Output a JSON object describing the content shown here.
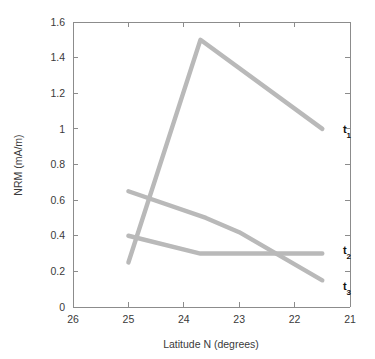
{
  "chart_data": {
    "type": "line",
    "title": "",
    "xlabel": "Latitude N (degrees)",
    "ylabel": "NRM (mA/m)",
    "xlim": [
      26,
      21
    ],
    "ylim": [
      0,
      1.6
    ],
    "x_reversed": true,
    "grid": false,
    "legend_position": "inline-right-end-labels",
    "xticks": [
      26,
      25,
      24,
      23,
      22,
      21
    ],
    "xtick_labels": [
      "26",
      "25",
      "24",
      "23",
      "22",
      "21"
    ],
    "yticks": [
      0,
      0.2,
      0.4,
      0.6,
      0.8,
      1.0,
      1.2,
      1.4,
      1.6
    ],
    "ytick_labels": [
      "0",
      "0.2",
      "0.4",
      "0.6",
      "0.8",
      "1",
      "1.2",
      "1.4",
      "1.6"
    ],
    "line_color": "#b9b9b9",
    "series": [
      {
        "name": "t1",
        "label": "t",
        "subscript": "1",
        "x": [
          25.0,
          23.7,
          21.5
        ],
        "values": [
          0.25,
          1.5,
          1.0
        ]
      },
      {
        "name": "t2",
        "label": "t",
        "subscript": "2",
        "x": [
          25.0,
          23.6,
          23.0,
          21.5
        ],
        "values": [
          0.65,
          0.5,
          0.42,
          0.15
        ]
      },
      {
        "name": "t3",
        "label": "t",
        "subscript": "3",
        "x": [
          25.0,
          23.7,
          23.0,
          21.5
        ],
        "values": [
          0.4,
          0.3,
          0.3,
          0.3
        ]
      }
    ],
    "annotations": [
      {
        "name": "t1",
        "text": "t",
        "subscript": "1",
        "x": 21.2,
        "y": 1.0
      },
      {
        "name": "t2",
        "text": "t",
        "subscript": "2",
        "x": 21.2,
        "y": 0.32
      },
      {
        "name": "t3",
        "text": "t",
        "subscript": "3",
        "x": 21.2,
        "y": 0.12
      }
    ]
  }
}
